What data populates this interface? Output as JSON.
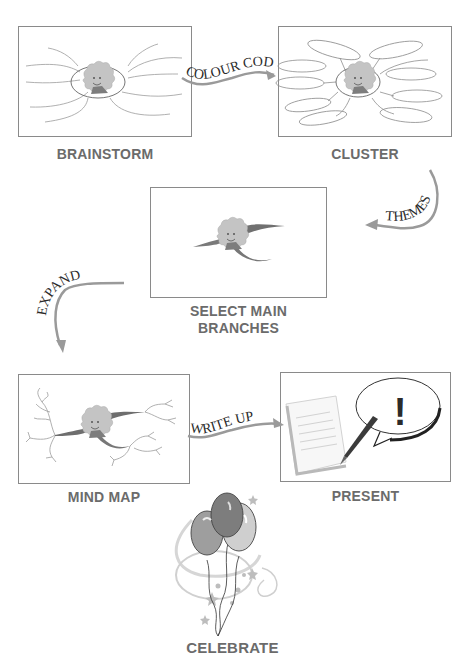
{
  "diagram": {
    "steps": [
      {
        "id": "brainstorm",
        "label": "BRAINSTORM"
      },
      {
        "id": "cluster",
        "label": "CLUSTER"
      },
      {
        "id": "select-main-branches",
        "label_line1": "SELECT MAIN",
        "label_line2": "BRANCHES"
      },
      {
        "id": "mind-map",
        "label": "MIND MAP"
      },
      {
        "id": "present",
        "label": "PRESENT"
      },
      {
        "id": "celebrate",
        "label": "CELEBRATE"
      }
    ],
    "transitions": [
      {
        "from": "brainstorm",
        "to": "cluster",
        "label": "COLOUR CODE"
      },
      {
        "from": "cluster",
        "to": "select-main-branches",
        "label": "THEMES"
      },
      {
        "from": "select-main-branches",
        "to": "mind-map",
        "label": "EXPAND"
      },
      {
        "from": "mind-map",
        "to": "present",
        "label": "WRITE UP"
      }
    ],
    "present_symbol": "!",
    "colors": {
      "box_border": "#8a8a8a",
      "label_text": "#6b6b6b",
      "arrow": "#9a9a9a",
      "branch_line": "#9c9c9c",
      "main_branch": "#6e6e6e",
      "face": "#bdbdbd",
      "balloon_dark": "#7d7d7d",
      "balloon_mid": "#9e9e9e",
      "balloon_light": "#cfcfcf"
    }
  }
}
